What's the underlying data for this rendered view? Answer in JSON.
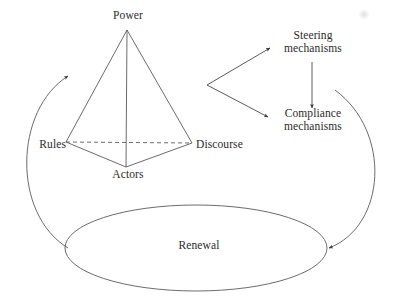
{
  "diagram": {
    "stroke_color": "#555555",
    "text_color": "#2b2b2b",
    "background_color": "#ffffff",
    "nodes": {
      "power": "Power",
      "rules": "Rules",
      "discourse": "Discourse",
      "actors": "Actors",
      "steering": "Steering mechanisms",
      "compliance": "Compliance mechanisms",
      "renewal": "Renewal"
    },
    "shapes": {
      "pyramid": {
        "apex": [
          127,
          30
        ],
        "left_vertex": [
          66,
          142
        ],
        "right_vertex": [
          192,
          143
        ],
        "front_vertex": [
          126,
          167
        ],
        "base_dashed_edge": "Rules to Discourse",
        "vertical_edge": "Power to Actors"
      },
      "renewal_ellipse": {
        "cx": 196,
        "cy": 248,
        "rx": 131,
        "ry": 43
      },
      "fork": {
        "origin": [
          207,
          85
        ],
        "targets": [
          "Steering mechanisms",
          "Compliance mechanisms"
        ]
      },
      "steering_to_compliance_arrow": {
        "from": [
          312,
          62
        ],
        "to": [
          312,
          110
        ]
      },
      "left_feedback_curve": {
        "from_ellipse_left": [
          68,
          248
        ],
        "arrow_tip": [
          68,
          76
        ],
        "direction": "upward"
      },
      "right_feedback_curve": {
        "from": [
          335,
          90
        ],
        "arrow_tip": [
          329,
          248
        ],
        "direction": "into ellipse"
      }
    },
    "artifact": "faint-scan-smudge"
  }
}
